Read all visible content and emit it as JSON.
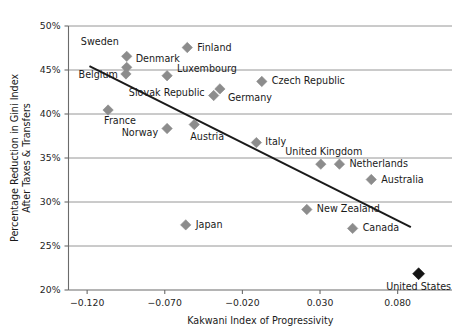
{
  "chart_data": {
    "type": "scatter",
    "title": "",
    "xlabel": "Kakwani Index of Progressivity",
    "ylabel": "Percentage Reduction in Gini Index After Taxes & Transfers",
    "ylabel_line1": "Percentage Reduction in Gini Index",
    "ylabel_line2": "After Taxes & Transfers",
    "xlim": [
      -0.132,
      0.115
    ],
    "ylim": [
      20,
      50
    ],
    "xticks": [
      -0.12,
      -0.07,
      -0.02,
      0.03,
      0.08
    ],
    "xtick_labels": [
      "−0.120",
      "−0.070",
      "−0.020",
      "0.030",
      "0.080"
    ],
    "yticks": [
      20,
      25,
      30,
      35,
      40,
      45,
      50
    ],
    "ytick_labels": [
      "20%",
      "25%",
      "30%",
      "35%",
      "40%",
      "45%",
      "50%"
    ],
    "grid": "horizontal",
    "legend": "none",
    "marker_shape": "diamond",
    "marker_color": "#8c8c8c",
    "highlight_color": "#141414",
    "trendline": {
      "present": true,
      "color": "#1a1a1a",
      "x_start": -0.1185,
      "y_start": 45.45,
      "x_end": 0.0885,
      "y_end": 27.15
    },
    "points": [
      {
        "name": "Sweden",
        "x": -0.0945,
        "y": 46.55,
        "label_dx": -8,
        "label_dy": -11,
        "label_anchor": "end",
        "highlight": false
      },
      {
        "name": "Denmark",
        "x": -0.0945,
        "y": 45.3,
        "label_dx": 9,
        "label_dy": -5,
        "label_anchor": "start",
        "highlight": false
      },
      {
        "name": "Belgium",
        "x": -0.095,
        "y": 44.55,
        "label_dx": -8,
        "label_dy": 4,
        "label_anchor": "end",
        "highlight": false
      },
      {
        "name": "Finland",
        "x": -0.0555,
        "y": 47.55,
        "label_dx": 10,
        "label_dy": 3,
        "label_anchor": "start",
        "highlight": false
      },
      {
        "name": "Luxembourg",
        "x": -0.0685,
        "y": 44.35,
        "label_dx": 10,
        "label_dy": -4,
        "label_anchor": "start",
        "highlight": false
      },
      {
        "name": "Slovak Republic",
        "x": -0.0385,
        "y": 42.1,
        "label_dx": -9,
        "label_dy": 0,
        "label_anchor": "end",
        "highlight": false
      },
      {
        "name": "Germany",
        "x": -0.0345,
        "y": 42.85,
        "label_dx": 8,
        "label_dy": 12,
        "label_anchor": "start",
        "highlight": false
      },
      {
        "name": "Czech Republic",
        "x": -0.0075,
        "y": 43.7,
        "label_dx": 10,
        "label_dy": 3,
        "label_anchor": "start",
        "highlight": false
      },
      {
        "name": "France",
        "x": -0.1065,
        "y": 40.45,
        "label_dx": -4,
        "label_dy": 14,
        "label_anchor": "start",
        "highlight": false
      },
      {
        "name": "Norway",
        "x": -0.0685,
        "y": 38.35,
        "label_dx": -9,
        "label_dy": 7,
        "label_anchor": "end",
        "highlight": false
      },
      {
        "name": "Austria",
        "x": -0.051,
        "y": 38.8,
        "label_dx": -4,
        "label_dy": 15,
        "label_anchor": "start",
        "highlight": false
      },
      {
        "name": "Italy",
        "x": -0.011,
        "y": 36.75,
        "label_dx": 9,
        "label_dy": 2,
        "label_anchor": "start",
        "highlight": false
      },
      {
        "name": "United Kingdom",
        "x": 0.0305,
        "y": 34.3,
        "label_dx": 3,
        "label_dy": -9,
        "label_anchor": "middle",
        "highlight": false
      },
      {
        "name": "Netherlands",
        "x": 0.0425,
        "y": 34.3,
        "label_dx": 10,
        "label_dy": 3,
        "label_anchor": "start",
        "highlight": false
      },
      {
        "name": "Australia",
        "x": 0.063,
        "y": 32.55,
        "label_dx": 10,
        "label_dy": 3,
        "label_anchor": "start",
        "highlight": false
      },
      {
        "name": "New Zealand",
        "x": 0.0215,
        "y": 29.15,
        "label_dx": 10,
        "label_dy": 3,
        "label_anchor": "start",
        "highlight": false
      },
      {
        "name": "Canada",
        "x": 0.051,
        "y": 27.0,
        "label_dx": 10,
        "label_dy": 3,
        "label_anchor": "start",
        "highlight": false
      },
      {
        "name": "Japan",
        "x": -0.0565,
        "y": 27.4,
        "label_dx": 10,
        "label_dy": 3,
        "label_anchor": "start",
        "highlight": false
      },
      {
        "name": "United States",
        "x": 0.0935,
        "y": 21.85,
        "label_dx": 0,
        "label_dy": 16,
        "label_anchor": "middle",
        "highlight": true
      }
    ]
  }
}
